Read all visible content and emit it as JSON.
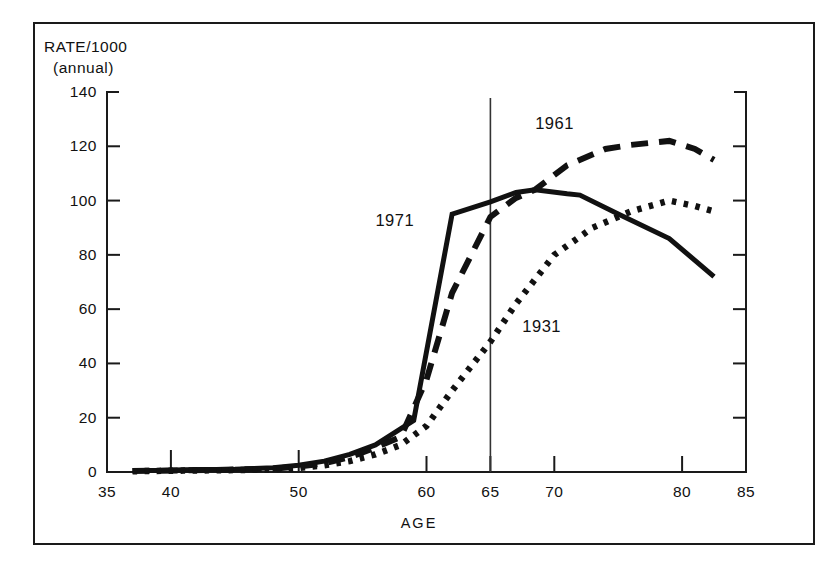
{
  "figure": {
    "frame": {
      "border_color": "#1a1a1a"
    },
    "background": "#ffffff"
  },
  "chart_data": {
    "type": "line",
    "title": "",
    "xlabel": "AGE",
    "ylabel": "RATE/1000",
    "ylabel_sub": "(annual)",
    "xlim": [
      35,
      85
    ],
    "ylim": [
      0,
      140
    ],
    "xticks": [
      35,
      40,
      50,
      60,
      65,
      70,
      80,
      85
    ],
    "xticklabels": [
      "35",
      "40",
      "50",
      "60",
      "65",
      "70",
      "80",
      "85"
    ],
    "yticks": [
      0,
      20,
      40,
      60,
      80,
      100,
      120,
      140
    ],
    "yticklabels": [
      "0",
      "20",
      "40",
      "60",
      "80",
      "100",
      "120",
      "140"
    ],
    "grid": false,
    "legend_position": "inline-annotations",
    "annotations": [
      {
        "text": "1961",
        "x": 68.5,
        "y": 128,
        "series": "1961"
      },
      {
        "text": "1971",
        "x": 56.0,
        "y": 92,
        "series": "1971"
      },
      {
        "text": "1931",
        "x": 67.5,
        "y": 53,
        "series": "1931"
      }
    ],
    "reference_lines": [
      {
        "orientation": "vertical",
        "x": 65,
        "label": "65",
        "color": "#333333"
      }
    ],
    "series": [
      {
        "name": "1971",
        "style": "solid",
        "color": "#111111",
        "x": [
          37,
          39,
          41,
          45,
          48,
          50,
          52,
          54,
          56,
          58,
          59,
          62,
          65,
          67,
          68.5,
          71,
          72,
          75,
          79,
          82.5
        ],
        "values": [
          0.5,
          0.6,
          0.8,
          1.0,
          1.6,
          2.5,
          4.0,
          6.5,
          10.0,
          16.0,
          19.0,
          95.0,
          99.5,
          103.0,
          104.0,
          102.5,
          102.0,
          95.0,
          86.0,
          72.0
        ]
      },
      {
        "name": "1961",
        "style": "dashed",
        "color": "#111111",
        "x": [
          37,
          41,
          45,
          48,
          50,
          52,
          54,
          56,
          58,
          60,
          62,
          65,
          67,
          68.5,
          71,
          74,
          76,
          79,
          81,
          82.5
        ],
        "values": [
          0.4,
          0.6,
          0.9,
          1.2,
          2.0,
          3.2,
          5.5,
          9.0,
          13.0,
          34.0,
          66.0,
          94.0,
          101.0,
          104.0,
          113.0,
          119.0,
          120.5,
          122.0,
          119.0,
          115.0
        ]
      },
      {
        "name": "1931",
        "style": "dotted",
        "color": "#111111",
        "x": [
          37,
          41,
          45,
          48,
          50,
          52,
          54,
          56,
          58,
          60,
          62,
          65,
          67,
          70,
          73,
          76,
          79,
          81,
          82.5
        ],
        "values": [
          0.3,
          0.5,
          0.7,
          1.0,
          1.5,
          2.5,
          4.0,
          6.5,
          10.0,
          17.0,
          30.0,
          48.0,
          62.0,
          80.0,
          90.0,
          96.0,
          100.0,
          98.0,
          96.0
        ]
      }
    ]
  }
}
